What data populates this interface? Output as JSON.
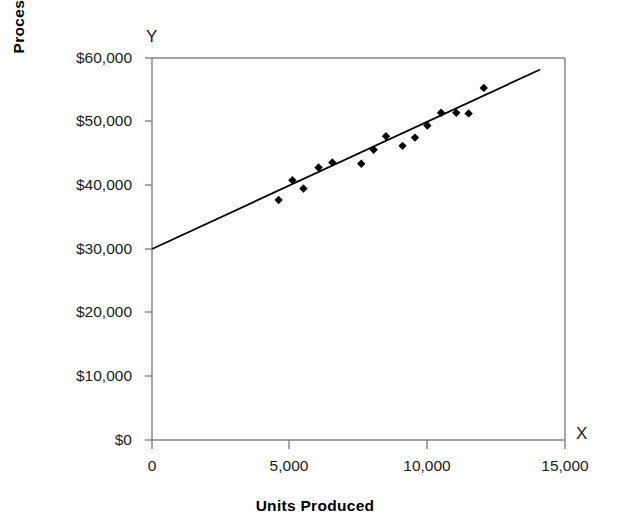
{
  "chart_data": {
    "type": "scatter",
    "title": "",
    "subtitle": "",
    "xlabel": "Units Produced",
    "ylabel": "Processing Cost",
    "x_axis_letter": "X",
    "y_axis_letter": "Y",
    "xlim": [
      0,
      15000
    ],
    "ylim": [
      0,
      60000
    ],
    "grid": false,
    "legend": null,
    "legend_position": "none",
    "x_tick_labels": [
      "0",
      "5,000",
      "10,000",
      "15,000"
    ],
    "x_tick_values": [
      0,
      5000,
      10000,
      15000
    ],
    "y_tick_labels": [
      "$0",
      "$10,000",
      "$20,000",
      "$30,000",
      "$40,000",
      "$50,000",
      "$60,000"
    ],
    "y_tick_values": [
      0,
      10000,
      20000,
      30000,
      40000,
      50000,
      60000
    ],
    "marker_shape": "diamond",
    "marker_color": "#000000",
    "line_color": "#000000",
    "points": [
      {
        "x": 4600,
        "y": 37700
      },
      {
        "x": 5100,
        "y": 40800
      },
      {
        "x": 5500,
        "y": 39500
      },
      {
        "x": 6050,
        "y": 42800
      },
      {
        "x": 6550,
        "y": 43600
      },
      {
        "x": 7600,
        "y": 43400
      },
      {
        "x": 8050,
        "y": 45600
      },
      {
        "x": 8500,
        "y": 47700
      },
      {
        "x": 9100,
        "y": 46200
      },
      {
        "x": 9550,
        "y": 47500
      },
      {
        "x": 10000,
        "y": 49400
      },
      {
        "x": 10500,
        "y": 51400
      },
      {
        "x": 11050,
        "y": 51400
      },
      {
        "x": 11500,
        "y": 51300
      },
      {
        "x": 12050,
        "y": 55300
      }
    ],
    "trend_line": {
      "type": "linear",
      "intercept": 30000,
      "slope": 2.0,
      "x_start": 0,
      "y_start": 30000,
      "x_end": 14100,
      "y_end": 58200
    }
  }
}
